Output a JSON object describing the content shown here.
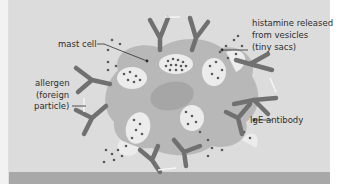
{
  "diagram": {
    "labels": {
      "mast_cell": "mast cell",
      "histamine_line1": "histamine released",
      "histamine_line2": "from vesicles",
      "histamine_line3": "(tiny sacs)",
      "allergen_line1": "allergen",
      "allergen_line2": "(foreign",
      "allergen_line3": "particle)",
      "ige": "IgE antibody"
    },
    "colors": {
      "panel": "#dcdcdc",
      "cell_body": "#b8b8b8",
      "nucleus": "#a6a6a6",
      "vesicle": "#ececec",
      "antibody": "#707070",
      "granule": "#5a5a5a",
      "bottom_band": "#a8a8a8"
    }
  }
}
